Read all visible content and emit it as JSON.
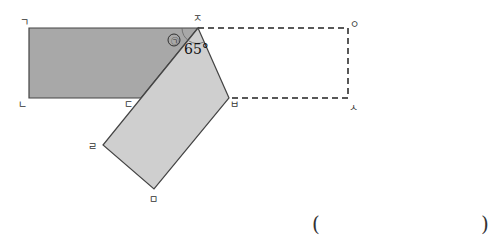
{
  "diagram": {
    "labels": {
      "g": "ㄱ",
      "n": "ㄴ",
      "d": "ㄷ",
      "r": "ㄹ",
      "m": "ㅁ",
      "b": "ㅂ",
      "s": "ㅅ",
      "o": "ㅇ",
      "j": "ㅈ"
    },
    "angle_marker": "㉠",
    "angle_value": "65°",
    "colors": {
      "rect_fill": "#a8a8a8",
      "folded_fill": "#cfcfcf",
      "stroke": "#444444"
    }
  },
  "answer": {
    "open_paren": "(",
    "close_paren": ")"
  }
}
